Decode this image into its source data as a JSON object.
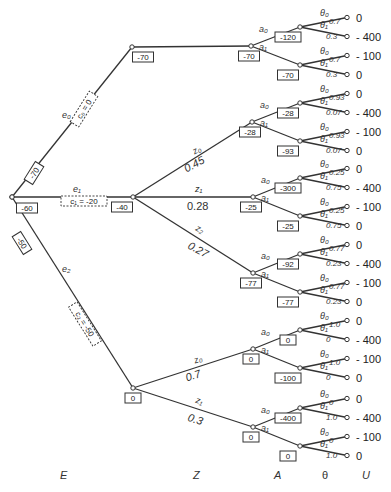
{
  "axis_labels": {
    "E": "E",
    "Z": "Z",
    "A": "A",
    "Theta": "θ",
    "U": "U"
  },
  "root": {
    "value": "-60"
  },
  "experiments": [
    {
      "label": "e₀",
      "cost": "c₀ = 0",
      "branch_value": "-70",
      "node_value": "-70"
    },
    {
      "label": "e₁",
      "cost": "c₁ = -20",
      "branch_value": "",
      "node_value": "-40"
    },
    {
      "label": "e₂",
      "cost": "c₂ = -50",
      "branch_value": "-50",
      "node_value": "0"
    }
  ],
  "z_branches": {
    "e1": [
      {
        "label": "z₀",
        "prob": "0.45",
        "node_value": "-28"
      },
      {
        "label": "z₁",
        "prob": "0.28",
        "node_value": "-25"
      },
      {
        "label": "z₂",
        "prob": "0.27",
        "node_value": "-77"
      }
    ],
    "e2": [
      {
        "label": "z₀",
        "prob": "0.7",
        "node_value": "0"
      },
      {
        "label": "z₁",
        "prob": "0.3",
        "node_value": "0"
      }
    ]
  },
  "action_labels": {
    "a0": "a₀",
    "a1": "a₁"
  },
  "theta_labels": {
    "t0": "θ₀",
    "t1": "θ₁"
  },
  "action_groups": [
    {
      "a0_value": "-120",
      "a1_value": "-70",
      "p0": "0.7",
      "p1": "0.3"
    },
    {
      "a0_value": "-28",
      "a1_value": "-93",
      "p0": "0.93",
      "p1": "0.07"
    },
    {
      "a0_value": "-300",
      "a1_value": "-25",
      "p0": "0.25",
      "p1": "0.75"
    },
    {
      "a0_value": "-92",
      "a1_value": "-77",
      "p0": "0.77",
      "p1": "0.23"
    },
    {
      "a0_value": "0",
      "a1_value": "-100",
      "p0": "1.0",
      "p1": "0"
    },
    {
      "a0_value": "-400",
      "a1_value": "0",
      "p0": "0",
      "p1": "1.0"
    }
  ],
  "utilities": {
    "a0": [
      "0",
      "- 400"
    ],
    "a1": [
      "- 100",
      "0"
    ]
  }
}
